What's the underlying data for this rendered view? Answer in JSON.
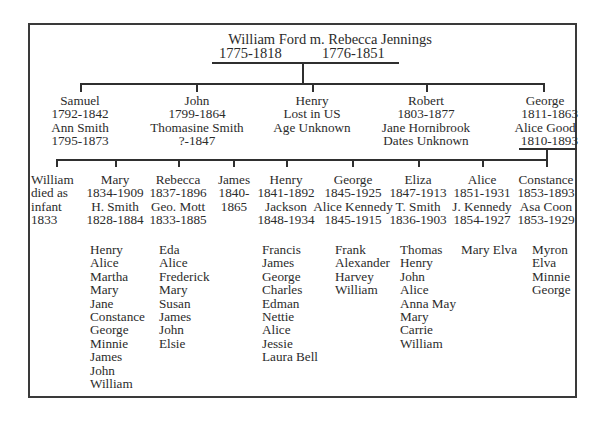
{
  "root": {
    "title": "William Ford m. Rebecca Jennings",
    "husband_dates": "1775-1818",
    "wife_dates": "1776-1851"
  },
  "generation2": [
    {
      "name": "Samuel",
      "lines": [
        "Samuel",
        "1792-1842",
        "Ann Smith",
        "1795-1873"
      ]
    },
    {
      "name": "John",
      "lines": [
        "John",
        "1799-1864",
        "Thomasine Smith",
        "?-1847"
      ]
    },
    {
      "name": "Henry",
      "lines": [
        "Henry",
        "Lost in US",
        "Age Unknown"
      ]
    },
    {
      "name": "Robert",
      "lines": [
        "Robert",
        "1803-1877",
        "Jane Hornibrook",
        "Dates Unknown"
      ]
    },
    {
      "name": "George",
      "lines": [
        "George",
        "1811-1863",
        "Alice Good",
        "1810-1893"
      ]
    }
  ],
  "generation3": [
    {
      "name": "William",
      "lines": [
        "William",
        "died as",
        "infant",
        "1833"
      ],
      "children": []
    },
    {
      "name": "Mary",
      "lines": [
        "Mary",
        "1834-1909",
        "H. Smith",
        "1828-1884"
      ],
      "children": [
        "Henry",
        "Alice",
        "Martha",
        "Mary",
        "Jane",
        "Constance",
        "George",
        "Minnie",
        "James",
        "John",
        "William"
      ]
    },
    {
      "name": "Rebecca",
      "lines": [
        "Rebecca",
        "1837-1896",
        "Geo. Mott",
        "1833-1885"
      ],
      "children": [
        "Eda",
        "Alice",
        "Frederick",
        "Mary",
        "Susan",
        "James",
        "John",
        "Elsie"
      ]
    },
    {
      "name": "James",
      "lines": [
        "James",
        "1840-",
        "1865"
      ],
      "children": []
    },
    {
      "name": "Henry",
      "lines": [
        "Henry",
        "1841-1892",
        "Jackson",
        "1848-1934"
      ],
      "children": [
        "Francis",
        "James",
        "George",
        "Charles",
        "Edman",
        "Nettie",
        "Alice",
        "Jessie",
        "Laura Bell"
      ]
    },
    {
      "name": "George",
      "lines": [
        "George",
        "1845-1925",
        "Alice Kennedy",
        "1845-1915"
      ],
      "children": [
        "Frank",
        "Alexander",
        "Harvey",
        "William"
      ]
    },
    {
      "name": "Eliza",
      "lines": [
        "Eliza",
        "1847-1913",
        "T. Smith",
        "1836-1903"
      ],
      "children": [
        "Thomas",
        "Henry",
        "John",
        "Alice",
        "Anna May",
        "Mary",
        "Carrie",
        "William"
      ]
    },
    {
      "name": "Alice",
      "lines": [
        "Alice",
        "1851-1931",
        "J. Kennedy",
        "1854-1927"
      ],
      "children": [
        "Mary Elva"
      ]
    },
    {
      "name": "Constance",
      "lines": [
        "Constance",
        "1853-1893",
        "Asa Coon",
        "1853-1929"
      ],
      "children": [
        "Myron",
        "Elva",
        "Minnie",
        "George"
      ]
    }
  ]
}
